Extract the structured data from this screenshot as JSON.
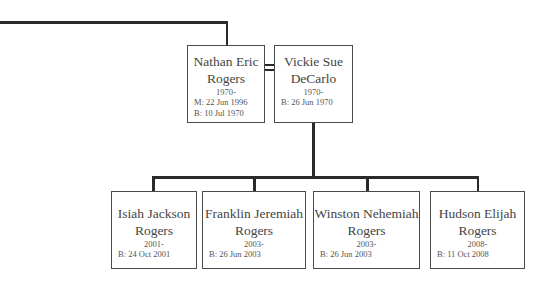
{
  "tree": {
    "parents": [
      {
        "id": "nathan",
        "name_line1": "Nathan Eric",
        "name_line2": "Rogers",
        "years": "1970-",
        "details": [
          "M: 22 Jun 1996",
          "B: 10 Jul 1970"
        ]
      },
      {
        "id": "vickie",
        "name_line1": "Vickie Sue",
        "name_line2": "DeCarlo",
        "years": "1970-",
        "details": [
          "B: 26 Jun 1970"
        ]
      }
    ],
    "children": [
      {
        "id": "isiah",
        "name_line1": "Isiah Jackson",
        "name_line2": "Rogers",
        "years": "2001-",
        "details": [
          "B: 24 Oct 2001"
        ]
      },
      {
        "id": "franklin",
        "name_line1": "Franklin Jeremiah",
        "name_line2": "Rogers",
        "years": "2003-",
        "details": [
          "B: 26 Jun 2003"
        ]
      },
      {
        "id": "winston",
        "name_line1": "Winston Nehemiah",
        "name_line2": "Rogers",
        "years": "2003-",
        "details": [
          "B: 26 Jun 2003"
        ]
      },
      {
        "id": "hudson",
        "name_line1": "Hudson Elijah",
        "name_line2": "Rogers",
        "years": "2008-",
        "details": [
          "B: 11 Oct 2008"
        ]
      }
    ]
  },
  "colors": {
    "line": "#2a2a2a",
    "box_border": "#4a4a4a",
    "text": "#444444"
  }
}
